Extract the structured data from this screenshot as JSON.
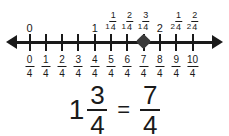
{
  "figure": {
    "accent_color": "#1a1a1a",
    "marker_color": "#3a3a3a",
    "background_color": "#ffffff"
  },
  "chart_data": {
    "type": "line",
    "title": "",
    "xlabel": "",
    "ylabel": "",
    "grid": false,
    "legend": "none",
    "axis_style": "double-arrow number line",
    "xlim": [
      0,
      2.5
    ],
    "tick_values": [
      0,
      0.25,
      0.5,
      0.75,
      1,
      1.25,
      1.5,
      1.75,
      2,
      2.25,
      2.5
    ],
    "tick_count": 11,
    "bottom_tick_labels": [
      {
        "num": "0",
        "den": "4"
      },
      {
        "num": "1",
        "den": "4"
      },
      {
        "num": "2",
        "den": "4"
      },
      {
        "num": "3",
        "den": "4"
      },
      {
        "num": "4",
        "den": "4"
      },
      {
        "num": "5",
        "den": "4"
      },
      {
        "num": "6",
        "den": "4"
      },
      {
        "num": "7",
        "den": "4"
      },
      {
        "num": "8",
        "den": "4"
      },
      {
        "num": "9",
        "den": "4"
      },
      {
        "num": "10",
        "den": "4"
      }
    ],
    "top_tick_labels": [
      {
        "whole": "0",
        "num": "",
        "den": ""
      },
      {
        "whole": "",
        "num": "",
        "den": ""
      },
      {
        "whole": "",
        "num": "",
        "den": ""
      },
      {
        "whole": "",
        "num": "",
        "den": ""
      },
      {
        "whole": "1",
        "num": "",
        "den": ""
      },
      {
        "whole": "1",
        "num": "1",
        "den": "4"
      },
      {
        "whole": "1",
        "num": "2",
        "den": "4"
      },
      {
        "whole": "1",
        "num": "3",
        "den": "4"
      },
      {
        "whole": "2",
        "num": "",
        "den": ""
      },
      {
        "whole": "2",
        "num": "1",
        "den": "4"
      },
      {
        "whole": "2",
        "num": "2",
        "den": "4"
      }
    ],
    "marker": {
      "index": 7,
      "value": 1.75,
      "label": "7/4",
      "shape": "diamond"
    }
  },
  "equation": {
    "left": {
      "whole": "1",
      "num": "3",
      "den": "4"
    },
    "operator": "=",
    "right": {
      "whole": "",
      "num": "7",
      "den": "4"
    }
  }
}
